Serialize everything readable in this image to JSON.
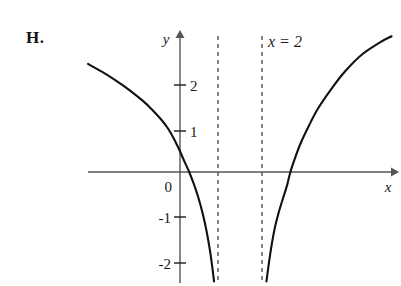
{
  "figure": {
    "problem_label": "H.",
    "background_color": "#ffffff",
    "curve_color": "#111111",
    "axis_color": "#555555",
    "asymptote_color": "#444444"
  },
  "chart_data": {
    "type": "line",
    "title": "",
    "subtitle": "",
    "xlabel": "x",
    "ylabel": "y",
    "xlim": [
      -2.0,
      4.7
    ],
    "ylim": [
      -2.6,
      3.1
    ],
    "grid": false,
    "legend": null,
    "axis_labels": {
      "x": "x",
      "y": "y"
    },
    "x_tick_labels": [],
    "y_tick_labels": [
      "2",
      "1",
      "0",
      "-1",
      "-2"
    ],
    "y_ticks": [
      2,
      1,
      0,
      -1,
      -2
    ],
    "origin_label": "0",
    "annotations": [
      {
        "text": "x = 2",
        "x": 2.0,
        "y": 3.0,
        "kind": "asymptote-label"
      }
    ],
    "asymptotes": [
      {
        "orientation": "vertical",
        "x": 0.8,
        "style": "dashed"
      },
      {
        "orientation": "vertical",
        "x": 1.8,
        "style": "dashed"
      }
    ],
    "x_intercepts": [
      0.2,
      2.4
    ],
    "series": [
      {
        "name": "left-branch",
        "style": "solid",
        "points": [
          [
            -2.0,
            2.35
          ],
          [
            -1.7,
            2.18
          ],
          [
            -1.4,
            1.99
          ],
          [
            -1.1,
            1.78
          ],
          [
            -0.8,
            1.54
          ],
          [
            -0.6,
            1.35
          ],
          [
            -0.4,
            1.13
          ],
          [
            -0.25,
            0.93
          ],
          [
            -0.1,
            0.66
          ],
          [
            0.0,
            0.45
          ],
          [
            0.1,
            0.22
          ],
          [
            0.2,
            0.0
          ],
          [
            0.3,
            -0.26
          ],
          [
            0.4,
            -0.56
          ],
          [
            0.5,
            -0.93
          ],
          [
            0.58,
            -1.3
          ],
          [
            0.65,
            -1.7
          ],
          [
            0.7,
            -2.05
          ],
          [
            0.74,
            -2.38
          ]
        ]
      },
      {
        "name": "right-branch",
        "style": "solid",
        "points": [
          [
            1.88,
            -2.38
          ],
          [
            1.93,
            -2.0
          ],
          [
            1.99,
            -1.6
          ],
          [
            2.06,
            -1.22
          ],
          [
            2.14,
            -0.9
          ],
          [
            2.24,
            -0.57
          ],
          [
            2.33,
            -0.28
          ],
          [
            2.4,
            0.0
          ],
          [
            2.5,
            0.3
          ],
          [
            2.62,
            0.62
          ],
          [
            2.8,
            1.0
          ],
          [
            3.0,
            1.38
          ],
          [
            3.3,
            1.82
          ],
          [
            3.6,
            2.2
          ],
          [
            3.95,
            2.55
          ],
          [
            4.35,
            2.82
          ],
          [
            4.6,
            2.95
          ]
        ]
      }
    ]
  }
}
